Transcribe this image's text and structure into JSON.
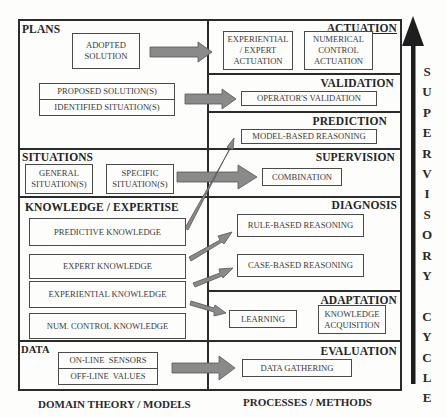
{
  "left_column": {
    "label": "DOMAIN THEORY / MODELS",
    "sections": [
      {
        "title": "PLANS",
        "boxes": [
          {
            "label": "ADOPTED\nSOLUTION"
          },
          {
            "label": "PROPOSED SOLUTION(S)"
          },
          {
            "label": "IDENTIFIED SITUATION(S)"
          }
        ]
      },
      {
        "title": "SITUATIONS",
        "boxes": [
          {
            "label": "GENERAL\nSITUATION(S)"
          },
          {
            "label": "SPECIFIC\nSITUATION(S)"
          }
        ]
      },
      {
        "title": "KNOWLEDGE / EXPERTISE",
        "boxes": [
          {
            "label": "PREDICTIVE KNOWLEDGE"
          },
          {
            "label": "EXPERT KNOWLEDGE"
          },
          {
            "label": "EXPERIENTIAL KNOWLEDGE"
          },
          {
            "label": "NUM. CONTROL KNOWLEDGE"
          }
        ]
      },
      {
        "title": "DATA",
        "boxes": [
          {
            "label": "ON-LINE  SENSORS"
          },
          {
            "label": "OFF-LINE  VALUES"
          }
        ]
      }
    ]
  },
  "right_column": {
    "label": "PROCESSES  / METHODS",
    "sections": [
      {
        "title": "ACTUATION",
        "boxes": [
          {
            "line1": "EXPERIENTIAL",
            "line2": "/ EXPERT",
            "line3": "ACTUATION"
          },
          {
            "line1": "NUMERICAL",
            "line2": "CONTROL",
            "line3": "ACTUATION"
          }
        ]
      },
      {
        "title": "VALIDATION",
        "boxes": [
          {
            "label": "OPERATOR'S VALIDATION"
          }
        ]
      },
      {
        "title": "PREDICTION",
        "boxes": [
          {
            "label": "MODEL-BASED REASONING"
          }
        ]
      },
      {
        "title": "SUPERVISION",
        "boxes": [
          {
            "label": "COMBINATION"
          }
        ]
      },
      {
        "title": "DIAGNOSIS",
        "boxes": [
          {
            "label": "RULE-BASED REASONING"
          },
          {
            "label": "CASE-BASED REASONING"
          }
        ]
      },
      {
        "title": "ADAPTATION",
        "boxes": [
          {
            "label": "LEARNING"
          },
          {
            "line1": "KNOWLEDGE",
            "line2": "ACQUISITION"
          }
        ]
      },
      {
        "title": "EVALUATION",
        "boxes": [
          {
            "label": "DATA GATHERING"
          }
        ]
      }
    ]
  },
  "cycle": {
    "letters": [
      "S",
      "U",
      "P",
      "E",
      "R",
      "V",
      "I",
      "S",
      "O",
      "R",
      "Y",
      " ",
      "C",
      "Y",
      "C",
      "L",
      "E"
    ],
    "label": "SUPERVISORY CYCLE",
    "direction": "up"
  },
  "arrows": [
    {
      "from": "ADOPTED SOLUTION",
      "to": "ACTUATION"
    },
    {
      "from": "PROPOSED SOLUTION(S) / IDENTIFIED SITUATION(S)",
      "to": "OPERATOR'S VALIDATION"
    },
    {
      "from": "SPECIFIC SITUATION(S)",
      "to": "COMBINATION"
    },
    {
      "from": "PREDICTIVE KNOWLEDGE",
      "to": "MODEL-BASED REASONING"
    },
    {
      "from": "EXPERT KNOWLEDGE",
      "to": "RULE-BASED REASONING"
    },
    {
      "from": "EXPERIENTIAL KNOWLEDGE",
      "to": "CASE-BASED REASONING"
    },
    {
      "from": "EXPERIENTIAL KNOWLEDGE",
      "to": "LEARNING"
    },
    {
      "from": "ON-LINE SENSORS / OFF-LINE VALUES",
      "to": "DATA GATHERING"
    }
  ],
  "colors": {
    "line": "#2b2b2b",
    "arrow_fill": "#8a8a8a",
    "arrow_stroke": "#4a4a4a",
    "background": "#fdfdfb"
  }
}
